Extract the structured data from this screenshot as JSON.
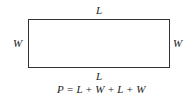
{
  "diagram": {
    "shape": "rectangle",
    "labels": {
      "top": "L",
      "bottom": "L",
      "left": "W",
      "right": "W"
    },
    "formula": "P = L + W + L + W",
    "colors": {
      "stroke": "#333333",
      "background": "#ffffff",
      "text": "#222222"
    }
  }
}
